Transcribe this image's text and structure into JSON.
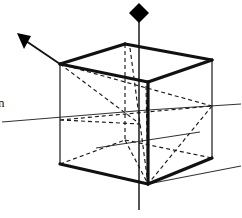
{
  "figure": {
    "kind": "line-art geometric diagram",
    "background_color": "#ffffff",
    "ink_color": "#111111",
    "canvas": {
      "width": 242,
      "height": 218
    }
  },
  "labels": {
    "left_axis_label": "n"
  },
  "markers": {
    "diamond": {
      "name": "black-diamond-marker",
      "center_x": 139,
      "center_y": 13,
      "radius": 9,
      "color": "#000000"
    },
    "arrowhead": {
      "name": "vector-arrowhead",
      "tip_x": 19,
      "tip_y": 34,
      "color": "#000000"
    }
  },
  "geometry": {
    "cube_vertices": {
      "front_top_left": [
        60,
        64
      ],
      "front_top_right": [
        148,
        82
      ],
      "back_top_right": [
        212,
        60
      ],
      "back_top_left": [
        125,
        44
      ],
      "front_bottom_left": [
        60,
        164
      ],
      "front_bottom_right": [
        148,
        184
      ],
      "back_bottom_right": [
        212,
        158
      ],
      "back_bottom_left": [
        125,
        140
      ]
    },
    "heavy_edges": [
      "front_top_left-back_top_left",
      "back_top_left-back_top_right",
      "back_top_right-front_top_right",
      "front_top_right-front_top_left",
      "front_top_right-front_bottom_right",
      "front_bottom_left-front_bottom_right",
      "front_bottom_right-back_bottom_right"
    ],
    "light_edges": [
      "front_top_left-front_bottom_left",
      "back_top_right-back_bottom_right",
      "front_bottom_left-back_bottom_left",
      "back_bottom_left-back_bottom_right"
    ],
    "hidden_dashed_edges": [
      "back_top_left-back_bottom_left"
    ],
    "internal_dashed_diagonals": [
      "front_top_left-center_right",
      "front_top_left-mid_front",
      "back_top_right-mid_front",
      "mid_front-front_bottom_right",
      "left_mid-center_right"
    ]
  },
  "axes": {
    "vertical": {
      "name": "vertical-axis",
      "top_x": 139,
      "top_y": 22,
      "bottom_x": 139,
      "bottom_y": 210
    },
    "horizontal_left": {
      "name": "horizontal-axis-left",
      "x1": 2,
      "y1": 122,
      "x2": 148,
      "y2": 110
    },
    "horizontal_right": {
      "name": "horizontal-axis-right",
      "x1": 148,
      "y1": 110,
      "x2": 241,
      "y2": 104
    },
    "depth_diagonal": {
      "name": "depth-axis-diagonal",
      "x1": 148,
      "y1": 184,
      "x2": 241,
      "y2": 166
    }
  },
  "vector": {
    "name": "direction-vector",
    "from_x": 60,
    "from_y": 64,
    "to_x": 22,
    "to_y": 38
  }
}
